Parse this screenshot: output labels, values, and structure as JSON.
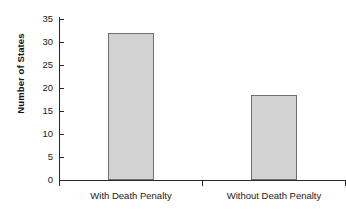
{
  "chart_data": {
    "type": "bar",
    "title": "",
    "xlabel": "",
    "ylabel": "Number of States",
    "categories": [
      "With Death Penalty",
      "Without Death Penalty"
    ],
    "values": [
      32,
      18.4
    ],
    "ylim": [
      0,
      35
    ],
    "y_ticks": [
      0,
      5,
      10,
      15,
      20,
      25,
      30,
      35
    ],
    "y_tick_labels": [
      "0",
      "5",
      "10",
      "15",
      "20",
      "25",
      "30",
      "35"
    ],
    "grid": false,
    "legend": false,
    "legend_position": "none",
    "bar_fill_color": "#d2d2d2",
    "bar_border_color": "#6f6f6f",
    "axis_color": "#2a2a2a",
    "background_color": "#ffffff"
  },
  "axes": {
    "y_title": "Number of States"
  }
}
